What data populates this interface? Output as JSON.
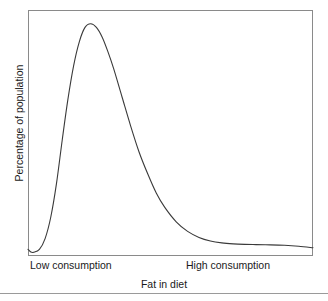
{
  "chart_data": {
    "type": "line",
    "title": "",
    "subtitle": "",
    "xlabel": "Fat in diet",
    "ylabel": "Percentage of population",
    "xticklabels": [
      "Low consumption",
      "High consumption"
    ],
    "yticklabels": [],
    "grid": false,
    "legend": null,
    "axis_color": "#8a8a8a",
    "line_color": "#3a3a3a",
    "line_width": 1,
    "xlim": [
      0,
      100
    ],
    "ylim": [
      0,
      100
    ],
    "series": [
      {
        "name": "Percentage of population",
        "x": [
          0,
          1,
          2,
          4,
          6,
          8,
          10,
          12,
          14,
          16,
          18,
          20,
          22,
          24,
          26,
          28,
          30,
          33,
          36,
          39,
          42,
          45,
          48,
          52,
          56,
          60,
          64,
          68,
          72,
          76,
          80,
          85,
          90,
          95,
          100
        ],
        "y": [
          1.5,
          0.4,
          0.3,
          1.5,
          6,
          15,
          29,
          47,
          64,
          78,
          88,
          94,
          95.5,
          94,
          90,
          84,
          77,
          65,
          53,
          42,
          33,
          25,
          19,
          13,
          9,
          6.5,
          5,
          4.2,
          3.8,
          3.6,
          3.5,
          3.4,
          3.2,
          2.8,
          2.2
        ]
      }
    ],
    "annotations": []
  },
  "axes": {
    "x_tick_low": "Low consumption",
    "x_tick_high": "High consumption",
    "x_title": "Fat in diet",
    "y_title": "Percentage of population"
  }
}
